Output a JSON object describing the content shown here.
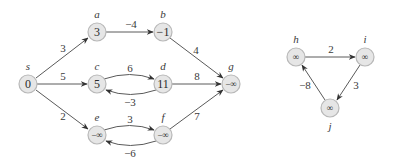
{
  "diagram": {
    "type": "directed-weighted-graph",
    "node_fill": "#e6e6e6",
    "node_stroke": "#b8b8b8",
    "edge_color": "#5a5a5a",
    "nodes": [
      {
        "id": "s",
        "label": "s",
        "value": "0",
        "x": 28,
        "y": 84,
        "label_pos": "above"
      },
      {
        "id": "a",
        "label": "a",
        "value": "3",
        "x": 97,
        "y": 32,
        "label_pos": "above"
      },
      {
        "id": "b",
        "label": "b",
        "value": "−1",
        "x": 163,
        "y": 32,
        "label_pos": "above"
      },
      {
        "id": "c",
        "label": "c",
        "value": "5",
        "x": 97,
        "y": 84,
        "label_pos": "above"
      },
      {
        "id": "d",
        "label": "d",
        "value": "11",
        "x": 163,
        "y": 84,
        "label_pos": "above"
      },
      {
        "id": "e",
        "label": "e",
        "value": "−∞",
        "x": 97,
        "y": 135,
        "label_pos": "above"
      },
      {
        "id": "f",
        "label": "f",
        "value": "−∞",
        "x": 163,
        "y": 135,
        "label_pos": "above"
      },
      {
        "id": "g",
        "label": "g",
        "value": "−∞",
        "x": 231,
        "y": 84,
        "label_pos": "above"
      },
      {
        "id": "h",
        "label": "h",
        "value": "∞",
        "x": 296,
        "y": 57,
        "label_pos": "above"
      },
      {
        "id": "i",
        "label": "i",
        "value": "∞",
        "x": 365,
        "y": 57,
        "label_pos": "above"
      },
      {
        "id": "j",
        "label": "j",
        "value": "∞",
        "x": 330,
        "y": 108,
        "label_pos": "below"
      }
    ],
    "edges": [
      {
        "from": "s",
        "to": "a",
        "weight": "3"
      },
      {
        "from": "s",
        "to": "c",
        "weight": "5"
      },
      {
        "from": "s",
        "to": "e",
        "weight": "2"
      },
      {
        "from": "a",
        "to": "b",
        "weight": "−4"
      },
      {
        "from": "b",
        "to": "g",
        "weight": "4"
      },
      {
        "from": "c",
        "to": "d",
        "weight": "6"
      },
      {
        "from": "d",
        "to": "c",
        "weight": "−3"
      },
      {
        "from": "d",
        "to": "g",
        "weight": "8"
      },
      {
        "from": "e",
        "to": "f",
        "weight": "3"
      },
      {
        "from": "f",
        "to": "e",
        "weight": "−6"
      },
      {
        "from": "f",
        "to": "g",
        "weight": "7"
      },
      {
        "from": "h",
        "to": "i",
        "weight": "2"
      },
      {
        "from": "i",
        "to": "j",
        "weight": "3"
      },
      {
        "from": "j",
        "to": "h",
        "weight": "−8"
      }
    ]
  }
}
